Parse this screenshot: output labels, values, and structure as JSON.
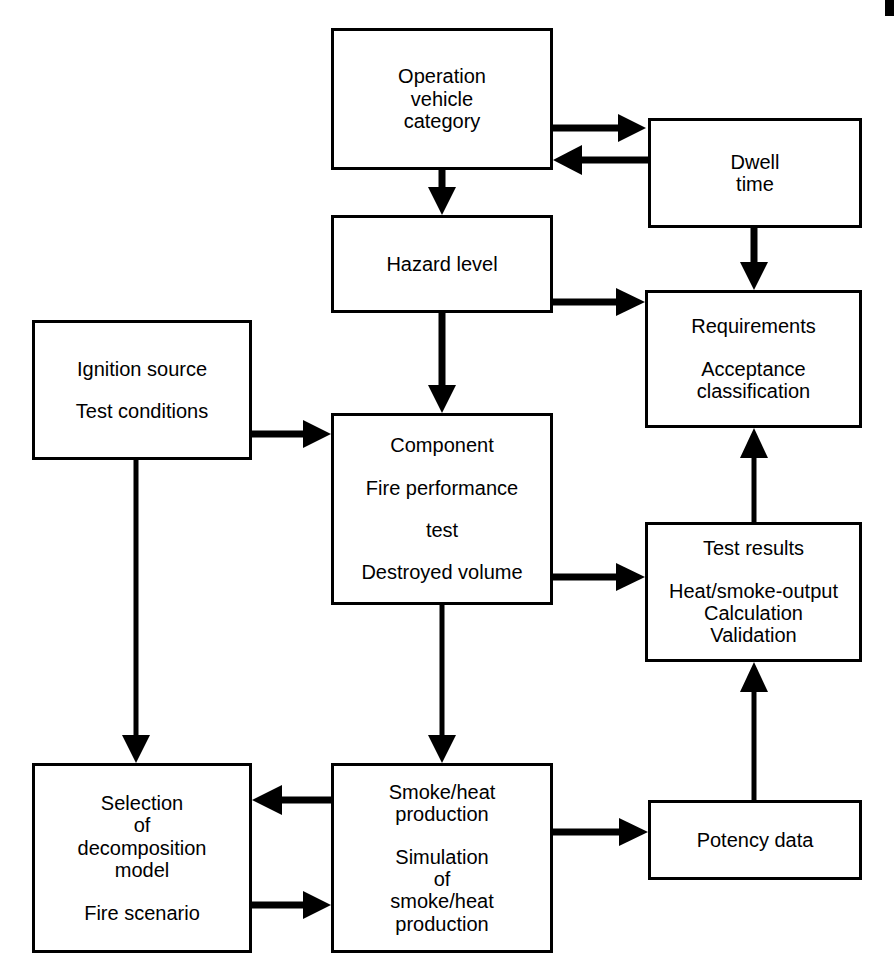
{
  "diagram": {
    "stroke_color": "#000000",
    "background_color": "#ffffff",
    "nodes": [
      {
        "id": "operation-vehicle-category",
        "groups": [
          [
            "Operation",
            "vehicle",
            "category"
          ]
        ]
      },
      {
        "id": "dwell-time",
        "groups": [
          [
            "Dwell",
            "time"
          ]
        ]
      },
      {
        "id": "hazard-level",
        "groups": [
          [
            "Hazard level"
          ]
        ]
      },
      {
        "id": "requirements",
        "groups": [
          [
            "Requirements"
          ],
          [
            "Acceptance",
            "classification"
          ]
        ]
      },
      {
        "id": "ignition-source",
        "groups": [
          [
            "Ignition source"
          ],
          [
            "Test conditions"
          ]
        ]
      },
      {
        "id": "component-fire-performance-test",
        "groups": [
          [
            "Component"
          ],
          [
            "Fire performance"
          ],
          [
            "test"
          ],
          [
            "Destroyed volume"
          ]
        ]
      },
      {
        "id": "test-results",
        "groups": [
          [
            "Test results"
          ],
          [
            "Heat/smoke-output",
            "Calculation",
            "Validation"
          ]
        ]
      },
      {
        "id": "selection-decomposition-model",
        "groups": [
          [
            "Selection",
            "of",
            "decomposition",
            "model"
          ],
          [
            "Fire scenario"
          ]
        ]
      },
      {
        "id": "smoke-heat-production",
        "groups": [
          [
            "Smoke/heat",
            "production"
          ],
          [
            "Simulation",
            "of",
            "smoke/heat",
            "production"
          ]
        ]
      },
      {
        "id": "potency-data",
        "groups": [
          [
            "Potency data"
          ]
        ]
      }
    ],
    "edges": [
      {
        "from": "operation-vehicle-category",
        "to": "dwell-time",
        "direction": "right"
      },
      {
        "from": "dwell-time",
        "to": "operation-vehicle-category",
        "direction": "left"
      },
      {
        "from": "operation-vehicle-category",
        "to": "hazard-level",
        "direction": "down"
      },
      {
        "from": "dwell-time",
        "to": "requirements",
        "direction": "down"
      },
      {
        "from": "hazard-level",
        "to": "requirements",
        "direction": "right"
      },
      {
        "from": "hazard-level",
        "to": "component-fire-performance-test",
        "direction": "down"
      },
      {
        "from": "ignition-source",
        "to": "component-fire-performance-test",
        "direction": "right"
      },
      {
        "from": "ignition-source",
        "to": "selection-decomposition-model",
        "direction": "down"
      },
      {
        "from": "component-fire-performance-test",
        "to": "test-results",
        "direction": "right"
      },
      {
        "from": "component-fire-performance-test",
        "to": "smoke-heat-production",
        "direction": "down"
      },
      {
        "from": "smoke-heat-production",
        "to": "selection-decomposition-model",
        "direction": "left"
      },
      {
        "from": "selection-decomposition-model",
        "to": "smoke-heat-production",
        "direction": "right"
      },
      {
        "from": "smoke-heat-production",
        "to": "potency-data",
        "direction": "right"
      },
      {
        "from": "potency-data",
        "to": "test-results",
        "direction": "up"
      },
      {
        "from": "test-results",
        "to": "requirements",
        "direction": "up"
      }
    ]
  },
  "nodes_text": {
    "operation": {
      "l1": "Operation",
      "l2": "vehicle",
      "l3": "category"
    },
    "dwell": {
      "l1": "Dwell",
      "l2": "time"
    },
    "hazard": {
      "l1": "Hazard level"
    },
    "requirements": {
      "l1": "Requirements",
      "l2": "Acceptance",
      "l3": "classification"
    },
    "ignition": {
      "l1": "Ignition source",
      "l2": "Test conditions"
    },
    "component": {
      "l1": "Component",
      "l2": "Fire performance",
      "l3": "test",
      "l4": "Destroyed volume"
    },
    "testresults": {
      "l1": "Test results",
      "l2": "Heat/smoke-output",
      "l3": "Calculation",
      "l4": "Validation"
    },
    "selection": {
      "l1": "Selection",
      "l2": "of",
      "l3": "decomposition",
      "l4": "model",
      "l5": "Fire scenario"
    },
    "smokeheat": {
      "l1": "Smoke/heat",
      "l2": "production",
      "l3": "Simulation",
      "l4": "of",
      "l5": "smoke/heat",
      "l6": "production"
    },
    "potency": {
      "l1": "Potency data"
    }
  }
}
